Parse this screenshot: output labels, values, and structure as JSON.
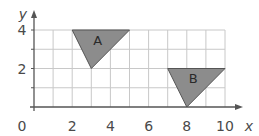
{
  "diagram": {
    "type": "coordinate-grid",
    "x_axis": {
      "label": "x",
      "min": 0,
      "max": 10,
      "tick_labels": [
        "0",
        "2",
        "4",
        "6",
        "8",
        "10"
      ]
    },
    "y_axis": {
      "label": "y",
      "min": 0,
      "max": 4,
      "tick_labels": [
        "2",
        "4"
      ]
    },
    "grid_step": 1,
    "shapes": [
      {
        "name": "A",
        "label": "A",
        "vertices": [
          [
            2,
            4
          ],
          [
            5,
            4
          ],
          [
            3,
            2
          ]
        ],
        "fill": "#8c8c8c",
        "stroke": "#555555"
      },
      {
        "name": "B",
        "label": "B",
        "vertices": [
          [
            7,
            2
          ],
          [
            10,
            2
          ],
          [
            8,
            0
          ]
        ],
        "fill": "#8c8c8c",
        "stroke": "#555555"
      }
    ],
    "colors": {
      "grid": "#c8c8c8",
      "axis": "#555555",
      "text": "#4a4a4a"
    }
  }
}
